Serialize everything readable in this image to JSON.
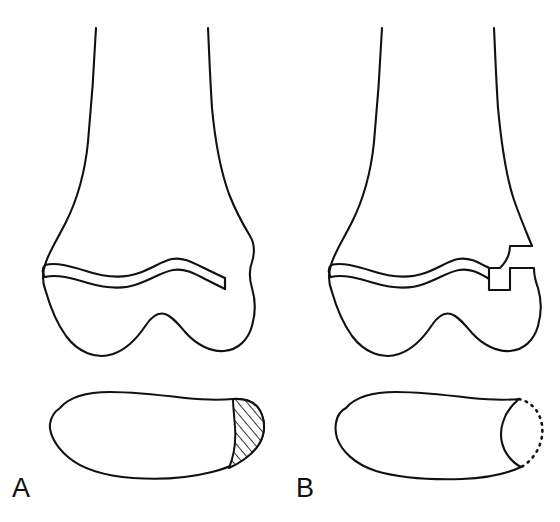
{
  "figure": {
    "background_color": "#ffffff",
    "line_color": "#111111",
    "width": 560,
    "height": 522
  },
  "panels": [
    {
      "id": "A",
      "label": "A",
      "label_x": 12,
      "label_y": 497,
      "description": "Distal femur, anteroposterior view, with transverse physeal separation; articular cross-section below shows a cross-hatched posterolateral region",
      "views": [
        {
          "name": "ap-view",
          "features": [
            "femoral-shaft",
            "metaphyseal-flare",
            "physis-band",
            "medial-condyle",
            "lateral-condyle",
            "intercondylar-notch"
          ]
        },
        {
          "name": "cross-section-view",
          "features": [
            "condylar-outline",
            "hatched-fragment"
          ],
          "fragment_style": "hatched"
        }
      ]
    },
    {
      "id": "B",
      "label": "B",
      "label_x": 296,
      "label_y": 497,
      "description": "Distal femur, anteroposterior view, with physeal separation plus a rectangular lateral metaphyseal (Thurston-Holland) fragment; articular cross-section below shows a concave defect outlined with dots",
      "views": [
        {
          "name": "ap-view",
          "features": [
            "femoral-shaft",
            "metaphyseal-flare",
            "physis-band",
            "metaphyseal-corner-fragment",
            "step-off",
            "medial-condyle",
            "lateral-condyle",
            "intercondylar-notch"
          ]
        },
        {
          "name": "cross-section-view",
          "features": [
            "condylar-outline",
            "concave-defect",
            "dotted-missing-fragment-arc"
          ],
          "fragment_style": "dotted"
        }
      ]
    }
  ],
  "legend": {
    "hatch_meaning": "Cross-hatched area marks the involved osteochondral segment",
    "dotted_meaning": "Dotted arc marks the outline of the displaced or absent fragment"
  }
}
